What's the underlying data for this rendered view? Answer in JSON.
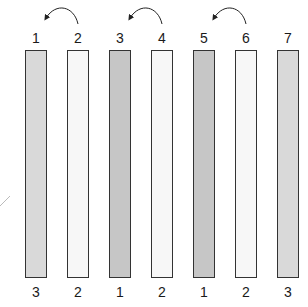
{
  "diagram": {
    "columns": [
      {
        "top_label": "1",
        "bottom_label": "3",
        "fill": "#d9d9d9",
        "x": 25
      },
      {
        "top_label": "2",
        "bottom_label": "2",
        "fill": "#f7f7f7",
        "x": 67
      },
      {
        "top_label": "3",
        "bottom_label": "1",
        "fill": "#c6c6c6",
        "x": 109
      },
      {
        "top_label": "4",
        "bottom_label": "2",
        "fill": "#f7f7f7",
        "x": 151
      },
      {
        "top_label": "5",
        "bottom_label": "1",
        "fill": "#c6c6c6",
        "x": 193
      },
      {
        "top_label": "6",
        "bottom_label": "2",
        "fill": "#f7f7f7",
        "x": 235
      },
      {
        "top_label": "7",
        "bottom_label": "3",
        "fill": "#d9d9d9",
        "x": 277
      }
    ],
    "arrows": [
      {
        "from": "2",
        "to": "1"
      },
      {
        "from": "4",
        "to": "3"
      },
      {
        "from": "6",
        "to": "5"
      }
    ]
  }
}
